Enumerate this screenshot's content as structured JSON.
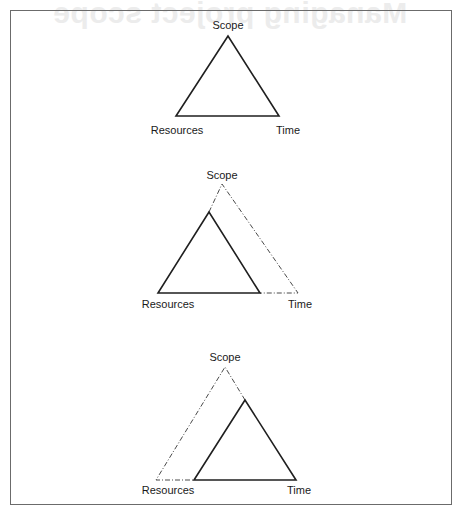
{
  "background_bleed": {
    "title": "Managing project scope"
  },
  "colors": {
    "line": "#1f1f1f",
    "dashed_line": "#4a4a4a",
    "frame": "#6b6b6b",
    "bleed_text": "#ececec"
  },
  "diagrams": [
    {
      "id": "baseline",
      "labels": {
        "top": "Scope",
        "left": "Resources",
        "right": "Time"
      }
    },
    {
      "id": "time-extended",
      "labels": {
        "top": "Scope",
        "left": "Resources",
        "right": "Time"
      }
    },
    {
      "id": "resources-extended",
      "labels": {
        "top": "Scope",
        "left": "Resources",
        "right": "Time"
      }
    }
  ]
}
